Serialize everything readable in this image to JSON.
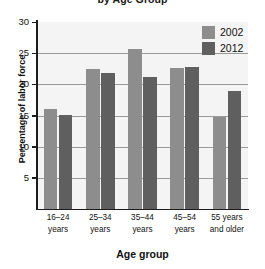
{
  "chart_data": {
    "type": "bar",
    "title": "by Age Group",
    "xlabel": "Age group",
    "ylabel": "Percentage of labor force",
    "categories": [
      "16–24\nyears",
      "25–34\nyears",
      "35–44\nyears",
      "45–54\nyears",
      "55 years\nand older"
    ],
    "series": [
      {
        "name": "2002",
        "color": "#8d8d8d",
        "values": [
          16.0,
          22.5,
          25.7,
          22.7,
          14.8
        ]
      },
      {
        "name": "2012",
        "color": "#5f5f5f",
        "values": [
          15.1,
          21.9,
          21.2,
          22.8,
          19.0
        ]
      }
    ],
    "ylim": [
      0,
      30
    ],
    "yticks": [
      5,
      10,
      15,
      20,
      25,
      30
    ],
    "ytick_labels": [
      "5",
      "10",
      "15",
      "20",
      "25",
      "30"
    ],
    "grid": true,
    "legend_position": "top-right"
  },
  "legend": {
    "items": [
      {
        "label": "2002",
        "color": "#8d8d8d"
      },
      {
        "label": "2012",
        "color": "#5f5f5f"
      }
    ]
  },
  "axes": {
    "y_title": "Percentage of labor force",
    "x_title": "Age group"
  },
  "title": "by Age Group"
}
